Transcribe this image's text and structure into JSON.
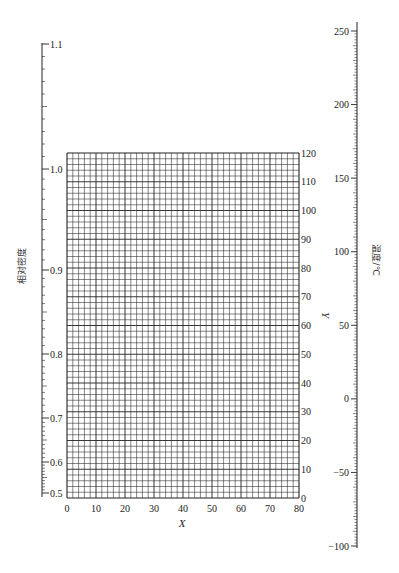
{
  "chart_data": {
    "type": "line",
    "title": "",
    "grid": {
      "x_range": [
        0,
        80
      ],
      "y_range": [
        0,
        120
      ],
      "x_minor_step": 2,
      "y_minor_step": 2,
      "x_major_step": 10,
      "y_major_step": 10,
      "x_ticks": [
        0,
        10,
        20,
        30,
        40,
        50,
        60,
        70,
        80
      ],
      "y_ticks": [
        0,
        10,
        20,
        30,
        40,
        50,
        60,
        70,
        80,
        90,
        100,
        110,
        120
      ],
      "xlabel": "X",
      "ylabel": "Y",
      "grid_on": true
    },
    "left_scale": {
      "label": "相对密度",
      "ticks": [
        {
          "value": "1.1",
          "y": 44
        },
        {
          "value": "1.0",
          "y": 169
        },
        {
          "value": "0.9",
          "y": 270
        },
        {
          "value": "0.8",
          "y": 354
        },
        {
          "value": "0.7",
          "y": 418
        },
        {
          "value": "0.6",
          "y": 462
        },
        {
          "value": "0.5",
          "y": 493
        }
      ],
      "range": [
        0.5,
        1.1
      ],
      "scale": "nonlinear"
    },
    "right_scale": {
      "label": "温度/℃",
      "ticks": [
        250,
        200,
        150,
        100,
        50,
        0,
        -50,
        -100
      ],
      "range": [
        -100,
        250
      ],
      "minor_step": 2,
      "scale": "linear"
    },
    "series": []
  },
  "labels": {
    "x_axis": "X",
    "y_axis": "Y",
    "left_axis": "相对密度",
    "right_axis": "温度/℃"
  }
}
